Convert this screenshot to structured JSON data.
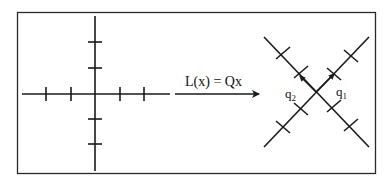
{
  "diagram": {
    "transform_label": "L(x) = Qx",
    "left_axes": {
      "description": "Standard axes with tick marks",
      "x_ticks": 4,
      "y_ticks": 4
    },
    "right_axes": {
      "description": "Rotated axes (45 degrees) with tick marks",
      "vector_labels": {
        "q1": "q",
        "q1_sub": "1",
        "q2": "q",
        "q2_sub": "2"
      }
    },
    "colors": {
      "stroke": "#1a1a1a",
      "background": "#ffffff"
    }
  }
}
